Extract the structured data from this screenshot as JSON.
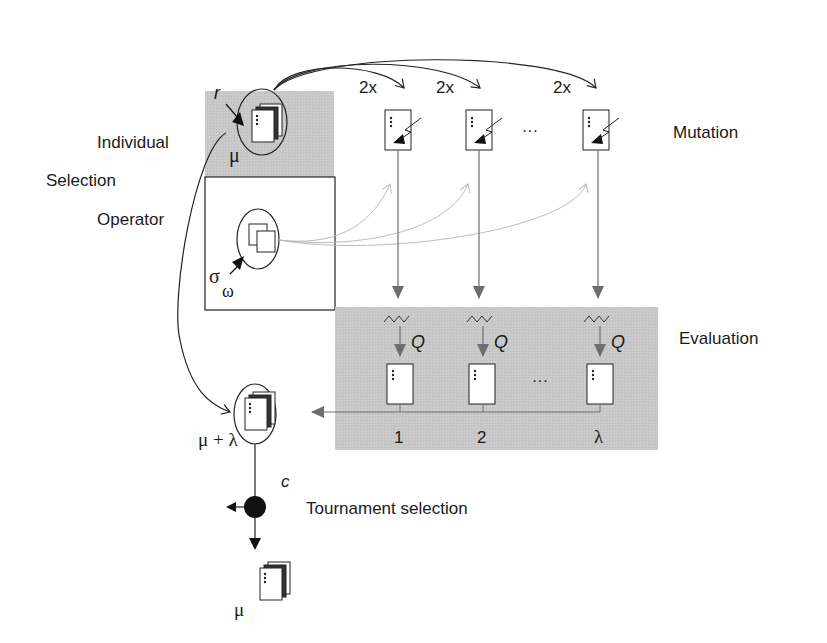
{
  "diagram": {
    "colors": {
      "gray_region": "#c9c9c9",
      "line": "#222222",
      "gray_arrow": "#6e6e6e",
      "dotted_arrow": "#b8b8b8"
    },
    "labels": {
      "individual": "Individual",
      "selection": "Selection",
      "operator": "Operator",
      "mutation": "Mutation",
      "evaluation": "Evaluation",
      "tournament": "Tournament selection",
      "r": "r",
      "mu_top": "μ",
      "sigma": "σ",
      "omega": "ω",
      "mu_plus_lambda": "μ + λ",
      "c": "c",
      "mu_bottom": "μ",
      "ellipsis_mutation": "···",
      "ellipsis_evaluation": "···"
    },
    "mutation_multipliers": [
      "2x",
      "2x",
      "2x"
    ],
    "evaluation": {
      "quality_label": "Q",
      "offspring_indices": [
        "1",
        "2",
        "λ"
      ]
    }
  }
}
